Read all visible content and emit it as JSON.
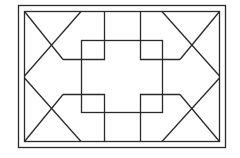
{
  "diagram": {
    "title": "",
    "colors": {
      "background": "#ffffff",
      "stroke": "#2a2a2a"
    },
    "outer_frame": {
      "x1": 18,
      "y1": 5,
      "x2": 225,
      "y2": 147
    },
    "inner_frame": {
      "x1": 24,
      "y1": 11,
      "x2": 219,
      "y2": 141
    },
    "center_square": {
      "x1": 81,
      "y1": 40,
      "x2": 162,
      "y2": 112
    }
  }
}
